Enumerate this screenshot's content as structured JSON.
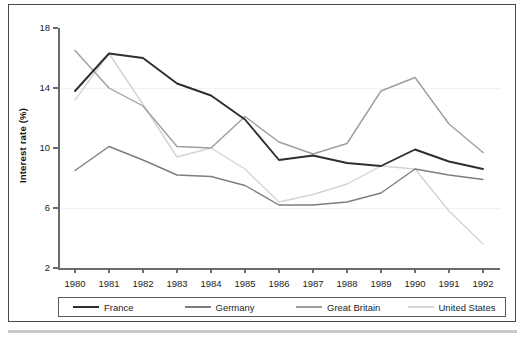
{
  "figure": {
    "ylabel": "Interest rate (%)"
  },
  "chart_data": {
    "type": "line",
    "title": "",
    "xlabel": "",
    "ylabel": "Interest rate (%)",
    "x": [
      1980,
      1981,
      1982,
      1983,
      1984,
      1985,
      1986,
      1987,
      1988,
      1989,
      1990,
      1991,
      1992
    ],
    "xtick_labels": [
      "1980",
      "1981",
      "1982",
      "1983",
      "1984",
      "1985",
      "1986",
      "1987",
      "1988",
      "1989",
      "1990",
      "1991",
      "1992"
    ],
    "ytick_labels": [
      "2",
      "6",
      "10",
      "14",
      "18"
    ],
    "yticks": [
      2,
      6,
      10,
      14,
      18
    ],
    "ylim": [
      2,
      18
    ],
    "xlim": [
      1980,
      1992
    ],
    "grid": false,
    "legend_position": "bottom",
    "series": [
      {
        "name": "France",
        "color": "#2e2e2e",
        "values": [
          13.8,
          16.3,
          16.0,
          14.3,
          13.5,
          11.9,
          9.2,
          9.5,
          9.0,
          8.8,
          9.9,
          9.1,
          8.6
        ]
      },
      {
        "name": "Germany",
        "color": "#7d7d7d",
        "values": [
          8.5,
          10.1,
          9.2,
          8.2,
          8.1,
          7.5,
          6.2,
          6.2,
          6.4,
          7.0,
          8.6,
          8.2,
          7.9
        ]
      },
      {
        "name": "Great Britain",
        "color": "#9e9e9e",
        "values": [
          16.5,
          14.0,
          12.8,
          10.1,
          10.0,
          12.1,
          10.4,
          9.6,
          10.3,
          13.8,
          14.7,
          11.6,
          9.7
        ]
      },
      {
        "name": "United States",
        "color": "#d4d4d4",
        "values": [
          13.2,
          16.3,
          12.9,
          9.4,
          10.0,
          8.6,
          6.4,
          6.9,
          7.6,
          8.8,
          8.6,
          5.8,
          3.6
        ]
      }
    ]
  },
  "legend": {
    "items": [
      {
        "label": "France",
        "color": "#2e2e2e"
      },
      {
        "label": "Germany",
        "color": "#7d7d7d"
      },
      {
        "label": "Great Britain",
        "color": "#9e9e9e"
      },
      {
        "label": "United States",
        "color": "#d4d4d4"
      }
    ]
  }
}
